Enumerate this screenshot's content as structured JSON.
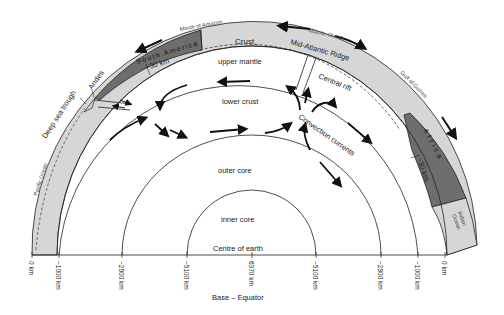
{
  "diagram": {
    "type": "cross-section",
    "colors": {
      "continent_fill": "#6e6e6e",
      "ocean_fill": "#d6d6d6",
      "line": "#222222",
      "background": "#ffffff"
    },
    "layers": {
      "crust": "Crust",
      "upper_mantle": "upper mantle",
      "lower_crust": "lower crust",
      "outer_core": "outer core",
      "inner_core": "inner core",
      "centre": "Centre of earth"
    },
    "features": {
      "mouth_of_amazon": "Mouth of Amazon",
      "south_america": "South America",
      "atlantic_ocean": "Atlantic Ocean",
      "mid_atlantic_ridge": "Mid-Atlantic Ridge",
      "central_rift": "Central rift",
      "gulf_of_guinea": "Gulf of Guinea",
      "africa": "Africa",
      "indian_ocean_1": "Indian",
      "indian_ocean_2": "Ocean",
      "andes": "Andes",
      "deep_sea_trough": "Deep sea trough",
      "pacific_ocean": "Pacific Ocean",
      "convection_currents": "Convection currents",
      "thickness_left": "~30 km",
      "thickness_right": "~30 km"
    },
    "axis": {
      "label": "Base – Equator",
      "ticks": [
        {
          "label": "0 km",
          "x": 32
        },
        {
          "label": "~1000 km",
          "x": 59
        },
        {
          "label": "~2900 km",
          "x": 122
        },
        {
          "label": "~5100 km",
          "x": 187
        },
        {
          "label": "6370 km",
          "x": 252
        },
        {
          "label": "~5100 km",
          "x": 316
        },
        {
          "label": "~2900 km",
          "x": 381
        },
        {
          "label": "~1000 km",
          "x": 418
        },
        {
          "label": "0 km",
          "x": 445
        }
      ]
    }
  }
}
